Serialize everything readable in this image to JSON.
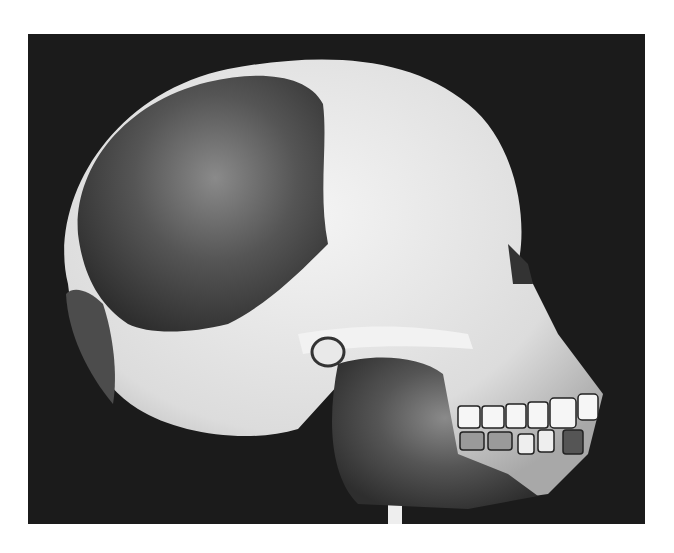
{
  "image": {
    "subject": "skull reconstruction",
    "style": "grayscale photograph",
    "background_color": "#1b1b1b",
    "page_color": "#ffffff",
    "bone_color": "#e4e4e4",
    "fossil_color": "#4a4a4a",
    "stand_color": "#eeeeee"
  }
}
